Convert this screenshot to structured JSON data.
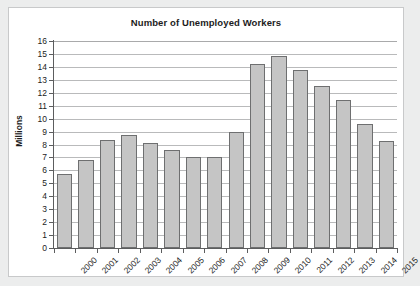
{
  "chart_data": {
    "type": "bar",
    "title": "Number of Unemployed Workers",
    "xlabel": "",
    "ylabel": "Millions",
    "categories": [
      "2000",
      "2001",
      "2002",
      "2003",
      "2004",
      "2005",
      "2006",
      "2007",
      "2008",
      "2009",
      "2010",
      "2011",
      "2012",
      "2013",
      "2014",
      "2015"
    ],
    "values": [
      5.7,
      6.8,
      8.35,
      8.75,
      8.15,
      7.6,
      7.0,
      7.05,
      8.95,
      14.25,
      14.85,
      13.75,
      12.5,
      11.45,
      9.6,
      8.3
    ],
    "ylim": [
      0,
      16
    ],
    "y_ticks": [
      0,
      1,
      2,
      3,
      4,
      5,
      6,
      7,
      8,
      9,
      10,
      11,
      12,
      13,
      14,
      15,
      16
    ],
    "grid": true,
    "legend": "none",
    "bar_color": "#c5c5c5",
    "bar_border_color": "#6e6f70",
    "axis_color": "#5c5d5e",
    "gridline_color": "#b9babb",
    "plot_background": "#ffffff",
    "page_background": "#eceded",
    "text_color": "#1c1c1c"
  }
}
